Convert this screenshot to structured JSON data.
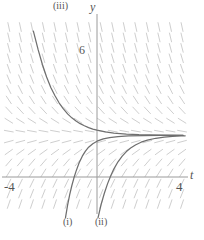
{
  "figure": {
    "kind": "direction-field-plot",
    "axis_labels": {
      "x": "t",
      "y": "y"
    },
    "tick_labels": {
      "y_six": "6",
      "x_left": "-4",
      "x_right": "4"
    },
    "curve_labels": {
      "one": "(i)",
      "two": "(ii)",
      "three": "(iii)"
    },
    "caption": "",
    "colors": {
      "background": "#ffffff",
      "axis": "#9a9a9a",
      "slope_mark": "#c8c8c8",
      "curve": "#6f6f6f",
      "text": "#555555"
    }
  },
  "chart_data": {
    "type": "line",
    "title": "",
    "xlabel": "t",
    "ylabel": "y",
    "xlim": [
      -4.6,
      4.6
    ],
    "ylim": [
      -2.1,
      7.6
    ],
    "grid": false,
    "legend": "none",
    "xticks": [
      -4,
      4
    ],
    "xticklabels": [
      "-4",
      "4"
    ],
    "yticks": [
      6
    ],
    "yticklabels": [
      "6"
    ],
    "equilibrium": 2,
    "annotations": [
      {
        "text": "(iii)",
        "x": -3.05,
        "y": 7.45
      },
      {
        "text": "(i)",
        "x": -1.55,
        "y": -1.95
      },
      {
        "text": "(ii)",
        "x": 0.05,
        "y": -1.95
      }
    ],
    "slope_field": {
      "description": "slope marks for dy/dt = -(y - 2) scaled; steeply negative above the equilibrium y = 2, flat on it, steeply positive below it",
      "t_range": [
        -4.2,
        4.2
      ],
      "t_step": 0.55,
      "y_range": [
        -1.8,
        7.3
      ],
      "y_step": 0.5,
      "equilibrium_level": 2,
      "mark_length": 9
    },
    "series": [
      {
        "name": "(iii)",
        "label": "(iii)",
        "description": "solution decreasing from large positive values toward the equilibrium y = 2 from above",
        "points": [
          [
            -3.03,
            7.0
          ],
          [
            -2.8,
            6.1
          ],
          [
            -2.6,
            5.4
          ],
          [
            -2.4,
            4.8
          ],
          [
            -2.2,
            4.3
          ],
          [
            -2.0,
            3.9
          ],
          [
            -1.8,
            3.55
          ],
          [
            -1.6,
            3.27
          ],
          [
            -1.4,
            3.03
          ],
          [
            -1.2,
            2.84
          ],
          [
            -1.0,
            2.69
          ],
          [
            -0.8,
            2.56
          ],
          [
            -0.6,
            2.46
          ],
          [
            -0.4,
            2.37
          ],
          [
            -0.2,
            2.3
          ],
          [
            0.0,
            2.25
          ],
          [
            0.4,
            2.17
          ],
          [
            0.8,
            2.11
          ],
          [
            1.4,
            2.06
          ],
          [
            2.0,
            2.03
          ],
          [
            3.0,
            2.01
          ],
          [
            4.1,
            2.0
          ]
        ]
      },
      {
        "name": "(i)",
        "label": "(i)",
        "description": "solution rising from below, crossing the t-axis and approaching the equilibrium y = 2 from below",
        "points": [
          [
            -1.5,
            -1.95
          ],
          [
            -1.4,
            -1.35
          ],
          [
            -1.3,
            -0.85
          ],
          [
            -1.2,
            -0.42
          ],
          [
            -1.1,
            -0.05
          ],
          [
            -1.0,
            0.27
          ],
          [
            -0.85,
            0.68
          ],
          [
            -0.7,
            1.0
          ],
          [
            -0.55,
            1.24
          ],
          [
            -0.4,
            1.43
          ],
          [
            -0.2,
            1.6
          ],
          [
            0.0,
            1.72
          ],
          [
            0.3,
            1.83
          ],
          [
            0.6,
            1.89
          ],
          [
            1.0,
            1.94
          ],
          [
            1.5,
            1.97
          ],
          [
            2.2,
            1.99
          ],
          [
            3.0,
            2.0
          ],
          [
            4.1,
            2.0
          ]
        ]
      },
      {
        "name": "(ii)",
        "label": "(ii)",
        "description": "solution rising from below, shifted right of (i), approaching the equilibrium y = 2 from below",
        "points": [
          [
            0.05,
            -1.95
          ],
          [
            0.2,
            -1.3
          ],
          [
            0.35,
            -0.78
          ],
          [
            0.5,
            -0.33
          ],
          [
            0.65,
            0.05
          ],
          [
            0.8,
            0.38
          ],
          [
            1.0,
            0.73
          ],
          [
            1.2,
            1.0
          ],
          [
            1.4,
            1.22
          ],
          [
            1.6,
            1.39
          ],
          [
            1.85,
            1.55
          ],
          [
            2.1,
            1.67
          ],
          [
            2.4,
            1.77
          ],
          [
            2.8,
            1.86
          ],
          [
            3.2,
            1.91
          ],
          [
            3.6,
            1.95
          ],
          [
            4.0,
            1.97
          ],
          [
            4.2,
            1.98
          ]
        ]
      }
    ]
  }
}
